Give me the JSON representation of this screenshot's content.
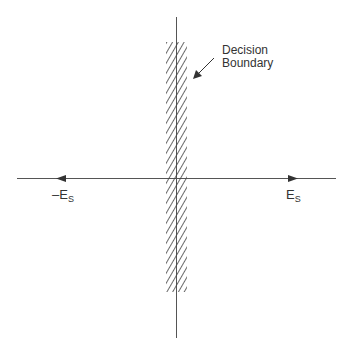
{
  "diagram": {
    "annotation": {
      "line1": "Decision",
      "line2": "Boundary"
    },
    "left_label": {
      "prefix": "–E",
      "sub": "S"
    },
    "right_label": {
      "prefix": "E",
      "sub": "S"
    },
    "colors": {
      "line": "#555555",
      "hatch": "#444444",
      "text": "#333333"
    }
  }
}
